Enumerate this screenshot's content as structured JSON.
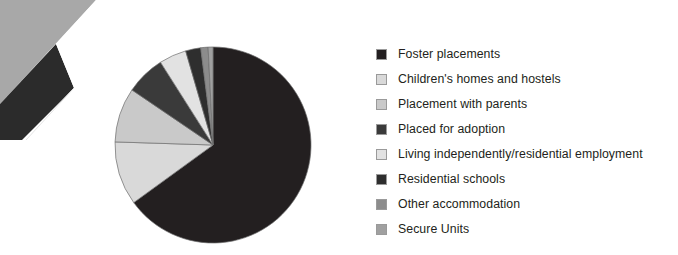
{
  "page": {
    "background_color": "#ffffff",
    "text_color": "#231f20"
  },
  "scan_artifact": {
    "name": "scanned-page-corner",
    "background_gray": "#a8a8a8",
    "wedge_color": "#2b2b2b",
    "page_white": "#ffffff"
  },
  "legend": {
    "position": "right",
    "items": [
      {
        "label": "Foster placements",
        "color": "#231f20"
      },
      {
        "label": "Children's homes and hostels",
        "color": "#d9d9d9"
      },
      {
        "label": "Placement with parents",
        "color": "#c9c9c9"
      },
      {
        "label": "Placed for adoption",
        "color": "#3a3a3a"
      },
      {
        "label": "Living independently/residential employment",
        "color": "#e2e2e2"
      },
      {
        "label": "Residential schools",
        "color": "#2e2e2e"
      },
      {
        "label": "Other accommodation",
        "color": "#8c8c8c"
      },
      {
        "label": "Secure Units",
        "color": "#a0a0a0"
      }
    ]
  },
  "chart_data": {
    "type": "pie",
    "title": "",
    "subtitle": "",
    "xlabel": "",
    "ylabel": "",
    "grid": false,
    "legend_position": "right",
    "start_angle_deg": 0,
    "direction": "clockwise",
    "center_px": [
      118,
      110
    ],
    "radius_px": 98,
    "labels": [
      "Foster placements",
      "Children's homes and hostels",
      "Placement with parents",
      "Placed for adoption",
      "Living independently/residential employment",
      "Residential schools",
      "Other accommodation",
      "Secure Units"
    ],
    "values": [
      65.0,
      10.5,
      9.0,
      6.5,
      4.5,
      2.5,
      1.2,
      0.8
    ],
    "unit": "%",
    "colors": [
      "#231f20",
      "#d9d9d9",
      "#c9c9c9",
      "#3a3a3a",
      "#e2e2e2",
      "#2e2e2e",
      "#8c8c8c",
      "#a0a0a0"
    ],
    "slice_order_note": "drawn clockwise from 12 o'clock; remaining slices continue counter-clockwise back toward 12 o'clock",
    "stroke_color": "#6e6e6e",
    "stroke_width": 0.7
  }
}
